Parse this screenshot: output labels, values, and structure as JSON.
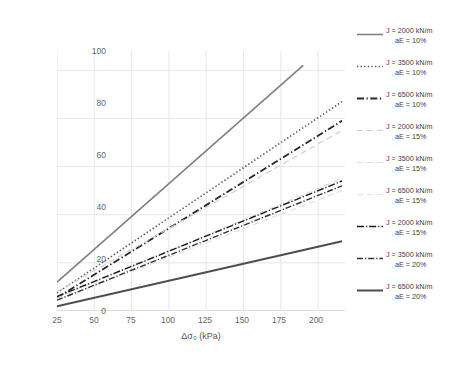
{
  "chart_data": {
    "type": "line",
    "title": "",
    "xlabel": "Δσ₀ (kPa)",
    "ylabel": "Δσv,s (kPa)",
    "xlim": [
      25,
      218
    ],
    "ylim": [
      0,
      108
    ],
    "xticks": [
      25,
      50,
      75,
      100,
      125,
      150,
      175,
      200
    ],
    "yticks": [
      0,
      20,
      40,
      60,
      80,
      100
    ],
    "grid": true,
    "legend_position": "right",
    "x": [
      25,
      218
    ],
    "series": [
      {
        "name": "J = 2000 kN/m aE = 10%",
        "J": 2000,
        "aE": "10%",
        "style": "solid",
        "color": "#808080",
        "width": 1.6,
        "x": [
          25,
          190
        ],
        "values": [
          12.0,
          102.0
        ]
      },
      {
        "name": "J = 3500 kN/m aE = 10%",
        "J": 3500,
        "aE": "10%",
        "style": "dotted",
        "color": "#595959",
        "width": 1.6,
        "x": [
          25,
          216
        ],
        "values": [
          7.5,
          87.0
        ]
      },
      {
        "name": "J = 6500 kN/m aE = 10%",
        "J": 6500,
        "aE": "10%",
        "style": "dashdot",
        "color": "#262626",
        "width": 1.8,
        "x": [
          25,
          216
        ],
        "values": [
          5.5,
          79.0
        ]
      },
      {
        "name": "J = 2000 kN/m aE = 15%",
        "J": 2000,
        "aE": "15%",
        "style": "dashed-light",
        "color": "#d0d0d0",
        "width": 1.2,
        "x": [
          25,
          216
        ],
        "values": [
          8.0,
          75.0
        ]
      },
      {
        "name": "J = 3500 kN/m aE = 15%",
        "J": 3500,
        "aE": "15%",
        "style": "dashed-light",
        "color": "#dcdcdc",
        "width": 1.2,
        "x": [
          25,
          216
        ],
        "values": [
          5.5,
          55.0
        ]
      },
      {
        "name": "J = 6500 kN/m aE = 15%",
        "J": 6500,
        "aE": "15%",
        "style": "dashed-light",
        "color": "#e2e2e2",
        "width": 1.2,
        "x": [
          25,
          216
        ],
        "values": [
          4.5,
          50.0
        ]
      },
      {
        "name": "J = 2000 kN/m aE = 15%",
        "J": 2000,
        "aE": "15%",
        "style": "dashdot-dark",
        "color": "#1a1a1a",
        "width": 1.4,
        "x": [
          25,
          216
        ],
        "values": [
          6.0,
          54.0
        ]
      },
      {
        "name": "J = 3500 kN/m aE = 20%",
        "J": 3500,
        "aE": "20%",
        "style": "dashdot-dark2",
        "color": "#333333",
        "width": 1.4,
        "x": [
          25,
          216
        ],
        "values": [
          4.5,
          52.0
        ]
      },
      {
        "name": "J = 6500 kN/m aE = 20%",
        "J": 6500,
        "aE": "20%",
        "style": "solid-dark",
        "color": "#4d4d4d",
        "width": 2.0,
        "x": [
          25,
          216
        ],
        "values": [
          2.0,
          29.0
        ]
      }
    ]
  },
  "axes": {
    "y_title": "Δσv,s (kPa)",
    "x_title": "Δσ₀ (kPa)",
    "yticks": [
      "100",
      "80",
      "60",
      "40",
      "20",
      "0"
    ],
    "xticks": [
      "25",
      "50",
      "75",
      "100",
      "125",
      "150",
      "175",
      "200"
    ]
  },
  "legend": {
    "items": [
      {
        "line1": "J = 2000 kN/m",
        "line2": "aE = 10%"
      },
      {
        "line1": "J = 3500 kN/m",
        "line2": "aE = 10%"
      },
      {
        "line1": "J = 6500 kN/m",
        "line2": "aE = 10%"
      },
      {
        "line1": "J = 2000 kN/m",
        "line2": "aE = 15%"
      },
      {
        "line1": "J = 3500 kN/m",
        "line2": "aE = 15%"
      },
      {
        "line1": "J = 6500 kN/m",
        "line2": "aE = 15%"
      },
      {
        "line1": "J = 2000 kN/m",
        "line2": "aE = 15%"
      },
      {
        "line1": "J = 3500 kN/m",
        "line2": "aE = 20%"
      },
      {
        "line1": "J = 6500 kN/m",
        "line2": "aE = 20%"
      }
    ]
  },
  "caption": {
    "text": ""
  }
}
